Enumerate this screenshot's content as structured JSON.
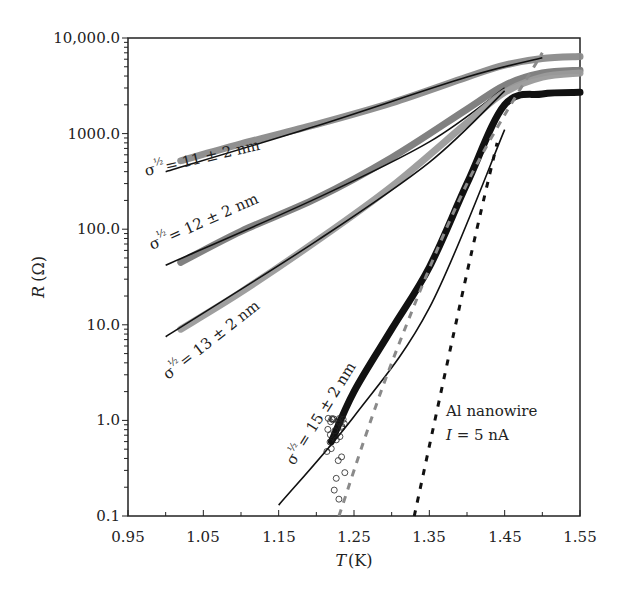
{
  "chart_data": {
    "type": "line",
    "title": "",
    "xlabel": "T (K)",
    "ylabel": "R (Ω)",
    "xlim": [
      0.95,
      1.55
    ],
    "ylim": [
      0.1,
      10000
    ],
    "yscale": "log",
    "grid": false,
    "x_ticks": [
      "0.95",
      "1.05",
      "1.15",
      "1.25",
      "1.35",
      "1.45",
      "1.55"
    ],
    "y_ticks": [
      "10,000.0",
      "1000.0",
      "100.0",
      "10.0",
      "1.0",
      "0.1"
    ],
    "series": [
      {
        "name": "σ½ = 11 ± 2 nm (data)",
        "style": "thick gray markers",
        "color": "#8a8a8a",
        "x": [
          1.02,
          1.1,
          1.2,
          1.3,
          1.4,
          1.45,
          1.5,
          1.55
        ],
        "y": [
          520,
          780,
          1250,
          2100,
          3900,
          5200,
          6100,
          6400
        ]
      },
      {
        "name": "σ½ = 11 ± 2 nm (fit)",
        "style": "solid black line",
        "color": "#111111",
        "x": [
          1.0,
          1.2,
          1.4,
          1.5
        ],
        "y": [
          400,
          1200,
          3900,
          6200
        ]
      },
      {
        "name": "σ½ = 12 ± 2 nm (data)",
        "style": "thick gray markers",
        "color": "#7a7a7a",
        "x": [
          1.02,
          1.1,
          1.2,
          1.3,
          1.4,
          1.45,
          1.5,
          1.55
        ],
        "y": [
          45,
          95,
          210,
          560,
          1800,
          3200,
          4300,
          4600
        ]
      },
      {
        "name": "σ½ = 12 ± 2 nm (fit)",
        "style": "solid black line",
        "color": "#111111",
        "x": [
          1.0,
          1.2,
          1.35,
          1.45
        ],
        "y": [
          42,
          210,
          820,
          3000
        ]
      },
      {
        "name": "σ½ = 13 ± 2 nm (data)",
        "style": "thick gray markers",
        "color": "#9a9a9a",
        "x": [
          1.02,
          1.1,
          1.2,
          1.3,
          1.4,
          1.45,
          1.5,
          1.55
        ],
        "y": [
          9,
          22,
          75,
          280,
          1300,
          2700,
          3900,
          4300
        ]
      },
      {
        "name": "σ½ = 13 ± 2 nm (fit)",
        "style": "solid black line",
        "color": "#111111",
        "x": [
          1.0,
          1.2,
          1.35,
          1.45
        ],
        "y": [
          7.5,
          75,
          500,
          2800
        ]
      },
      {
        "name": "σ½ = 15 ± 2 nm (data)",
        "style": "black open circles",
        "color": "#111111",
        "x": [
          1.22,
          1.25,
          1.3,
          1.35,
          1.4,
          1.45,
          1.5,
          1.55
        ],
        "y": [
          0.6,
          2.0,
          9,
          40,
          300,
          2000,
          2600,
          2700
        ]
      },
      {
        "name": "σ½ = 15 ± 2 nm (fit)",
        "style": "solid black line",
        "color": "#111111",
        "x": [
          1.15,
          1.25,
          1.35,
          1.45
        ],
        "y": [
          0.13,
          1.1,
          15,
          1100
        ]
      },
      {
        "name": "gray dashed",
        "style": "gray dashed line",
        "color": "#8a8a8a",
        "x": [
          1.23,
          1.3,
          1.4,
          1.5
        ],
        "y": [
          0.1,
          4,
          300,
          7000
        ]
      },
      {
        "name": "black dotted",
        "style": "black dotted line",
        "color": "#111111",
        "x": [
          1.33,
          1.4,
          1.44
        ],
        "y": [
          0.1,
          35,
          800
        ]
      }
    ],
    "annotations": [
      "σ½ = 11 ± 2 nm",
      "σ½ = 12 ± 2 nm",
      "σ½ = 13 ± 2 nm",
      "σ½ = 15 ± 2 nm",
      "Al nanowire",
      "I = 5 nA"
    ]
  },
  "labels": {
    "xlabel_var": "T",
    "xlabel_unit": "(K)",
    "ylabel_var": "R",
    "ylabel_unit": "(Ω)",
    "sigma": "σ",
    "half": "½",
    "ann_11": "= 11 ± 2 nm",
    "ann_12": "= 12 ± 2 nm",
    "ann_13": "= 13 ± 2 nm",
    "ann_15": "= 15 ± 2 nm",
    "legend_line1": "Al nanowire",
    "legend_var": "I",
    "legend_rest": " = 5 nA"
  }
}
